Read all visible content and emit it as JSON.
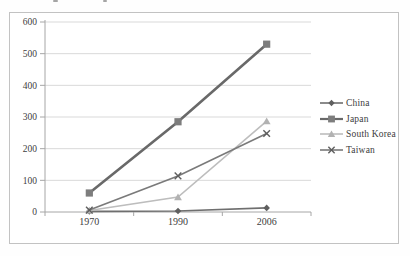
{
  "chart_data": {
    "type": "line",
    "title": "",
    "x_categories": [
      "1970",
      "1990",
      "2006"
    ],
    "y_ticks": [
      0,
      100,
      200,
      300,
      400,
      500,
      600
    ],
    "ylim": [
      0,
      600
    ],
    "grid": "horizontal",
    "legend_position": "right",
    "colors": {
      "axis": "#a6a6a6",
      "gridline": "#d9d9d9",
      "label": "#404040",
      "frame_border": "#c2c2c2",
      "background": "#ffffff"
    },
    "series": [
      {
        "name": "China",
        "marker": "diamond",
        "line_color": "#6f6f6f",
        "marker_color": "#5f5f5f",
        "line_width": 1.6,
        "values": [
          2,
          3,
          13
        ]
      },
      {
        "name": "Japan",
        "marker": "square",
        "line_color": "#696969",
        "marker_color": "#7d7d7d",
        "line_width": 2.6,
        "values": [
          60,
          285,
          530
        ]
      },
      {
        "name": "South Korea",
        "marker": "triangle",
        "line_color": "#bdbdbd",
        "marker_color": "#b2b2b2",
        "line_width": 1.6,
        "values": [
          5,
          47,
          287
        ]
      },
      {
        "name": "Taiwan",
        "marker": "x",
        "line_color": "#7a7a7a",
        "marker_color": "#5e5e5e",
        "line_width": 1.6,
        "values": [
          6,
          114,
          248
        ]
      }
    ]
  }
}
